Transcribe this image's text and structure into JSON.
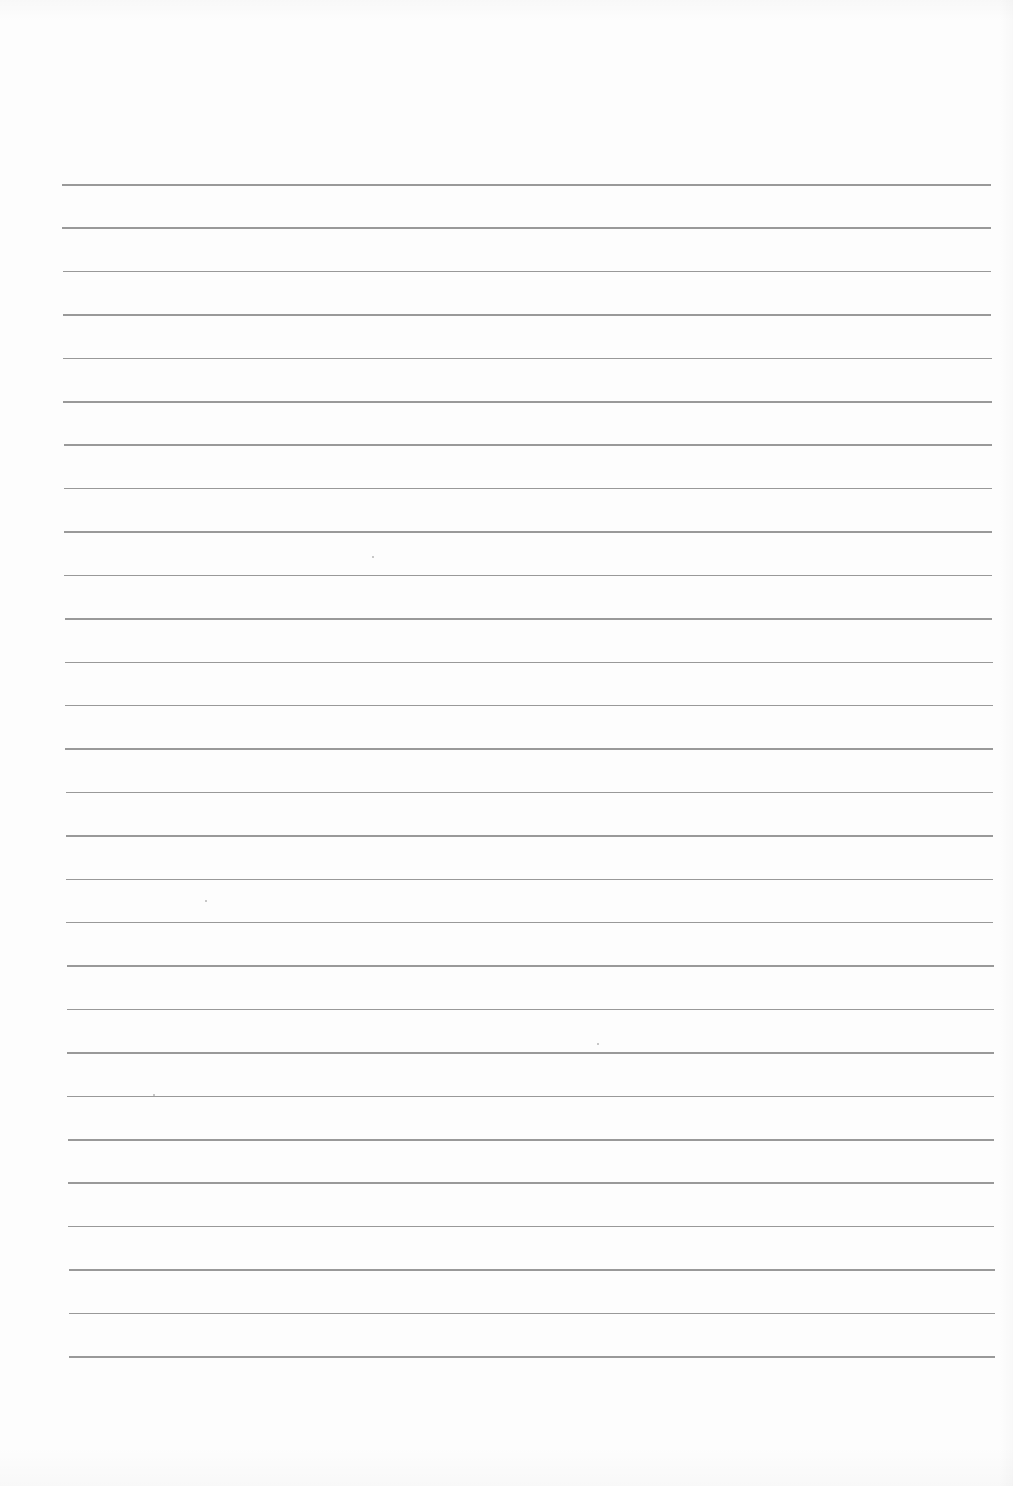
{
  "page": {
    "type": "ruled-paper",
    "background_color": "#fdfdfd",
    "line_color": "#8e8e8e",
    "line_count": 28,
    "first_line": {
      "y": 184,
      "x_start": 62,
      "x_end": 991
    },
    "last_line": {
      "y": 1356,
      "x_start": 69,
      "x_end": 995
    },
    "text": ""
  }
}
